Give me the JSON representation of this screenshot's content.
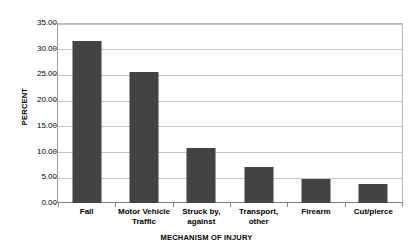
{
  "chart_data": {
    "type": "bar",
    "title": "",
    "xlabel": "MECHANISM OF INJURY",
    "ylabel": "PERCENT",
    "categories": [
      "Fall",
      "Motor Vehicle Traffic",
      "Struck by, against",
      "Transport, other",
      "Firearm",
      "Cut/pierce"
    ],
    "category_lines": [
      [
        "Fall"
      ],
      [
        "Motor Vehicle",
        "Traffic"
      ],
      [
        "Struck by,",
        "against"
      ],
      [
        "Transport,",
        "other"
      ],
      [
        "Firearm"
      ],
      [
        "Cut/pierce"
      ]
    ],
    "values": [
      31.5,
      25.5,
      10.7,
      7.0,
      4.7,
      3.7
    ],
    "ylim": [
      0,
      35
    ],
    "ytick_values": [
      0,
      5,
      10,
      15,
      20,
      25,
      30,
      35
    ],
    "ytick_labels": [
      "0.00",
      "5.00",
      "10.00",
      "15.00",
      "20.00",
      "25.00",
      "30.00",
      "35.00"
    ],
    "grid": true,
    "legend": false,
    "legend_position": "none",
    "bar_color": "#3f3f3f",
    "gridline_color": "#c3c3c3",
    "axis_color": "#7d7d7d",
    "background_color": "#ffffff"
  }
}
